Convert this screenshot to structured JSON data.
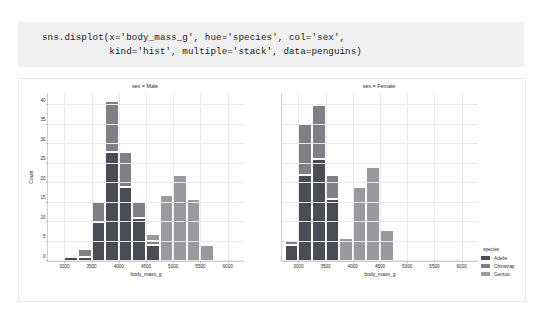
{
  "code_cell": {
    "line1": "sns.displot(x='body_mass_g', hue='species', col='sex',",
    "line2": "            kind='hist', multiple='stack', data=penguins)"
  },
  "legend": {
    "title": "species",
    "entries": [
      {
        "label": "Adelie",
        "color": "#4c4c54"
      },
      {
        "label": "Chinstrap",
        "color": "#7f7f85"
      },
      {
        "label": "Gentoo",
        "color": "#9a9a9e"
      }
    ]
  },
  "chart_data": {
    "type": "bar",
    "title": "",
    "xlabel": "body_mass_g",
    "ylabel": "Count",
    "xlim": [
      2700,
      6300
    ],
    "ylim": [
      0,
      43
    ],
    "xticks": [
      3000,
      3500,
      4000,
      4500,
      5000,
      5500,
      6000
    ],
    "yticks": [
      0,
      5,
      10,
      15,
      20,
      25,
      30,
      35,
      40
    ],
    "grid": true,
    "legend_position": "right",
    "stacked": true,
    "bin_width": 250,
    "series_names": [
      "Adelie",
      "Chinstrap",
      "Gentoo"
    ],
    "facets": [
      {
        "title": "sex = Male",
        "col_value": "Male",
        "bins": [
          {
            "x0": 3000,
            "x1": 3250,
            "Adelie": 1,
            "Chinstrap": 0,
            "Gentoo": 0,
            "total": 1
          },
          {
            "x0": 3250,
            "x1": 3500,
            "Adelie": 1,
            "Chinstrap": 2,
            "Gentoo": 0,
            "total": 3
          },
          {
            "x0": 3500,
            "x1": 3750,
            "Adelie": 10,
            "Chinstrap": 5,
            "Gentoo": 0,
            "total": 15
          },
          {
            "x0": 3750,
            "x1": 4000,
            "Adelie": 28,
            "Chinstrap": 13,
            "Gentoo": 0,
            "total": 41
          },
          {
            "x0": 4000,
            "x1": 4250,
            "Adelie": 19,
            "Chinstrap": 9,
            "Gentoo": 0,
            "total": 28
          },
          {
            "x0": 4250,
            "x1": 4500,
            "Adelie": 11,
            "Chinstrap": 4,
            "Gentoo": 0,
            "total": 15
          },
          {
            "x0": 4500,
            "x1": 4750,
            "Adelie": 4,
            "Chinstrap": 1,
            "Gentoo": 2,
            "total": 7
          },
          {
            "x0": 4750,
            "x1": 5000,
            "Adelie": 0,
            "Chinstrap": 0,
            "Gentoo": 17,
            "total": 17
          },
          {
            "x0": 5000,
            "x1": 5250,
            "Adelie": 0,
            "Chinstrap": 0,
            "Gentoo": 22,
            "total": 22
          },
          {
            "x0": 5250,
            "x1": 5500,
            "Adelie": 0,
            "Chinstrap": 0,
            "Gentoo": 16,
            "total": 16
          },
          {
            "x0": 5500,
            "x1": 5750,
            "Adelie": 0,
            "Chinstrap": 0,
            "Gentoo": 4,
            "total": 4
          }
        ]
      },
      {
        "title": "sex = Female",
        "col_value": "Female",
        "bins": [
          {
            "x0": 2750,
            "x1": 3000,
            "Adelie": 4,
            "Chinstrap": 1,
            "Gentoo": 0,
            "total": 5
          },
          {
            "x0": 3000,
            "x1": 3250,
            "Adelie": 22,
            "Chinstrap": 13,
            "Gentoo": 0,
            "total": 35
          },
          {
            "x0": 3250,
            "x1": 3500,
            "Adelie": 26,
            "Chinstrap": 14,
            "Gentoo": 0,
            "total": 40
          },
          {
            "x0": 3500,
            "x1": 3750,
            "Adelie": 16,
            "Chinstrap": 6,
            "Gentoo": 0,
            "total": 22
          },
          {
            "x0": 3750,
            "x1": 4000,
            "Adelie": 0,
            "Chinstrap": 0,
            "Gentoo": 6,
            "total": 6
          },
          {
            "x0": 4000,
            "x1": 4250,
            "Adelie": 0,
            "Chinstrap": 0,
            "Gentoo": 19,
            "total": 19
          },
          {
            "x0": 4250,
            "x1": 4500,
            "Adelie": 0,
            "Chinstrap": 0,
            "Gentoo": 24,
            "total": 24
          },
          {
            "x0": 4500,
            "x1": 4750,
            "Adelie": 0,
            "Chinstrap": 0,
            "Gentoo": 8,
            "total": 8
          }
        ]
      }
    ]
  }
}
